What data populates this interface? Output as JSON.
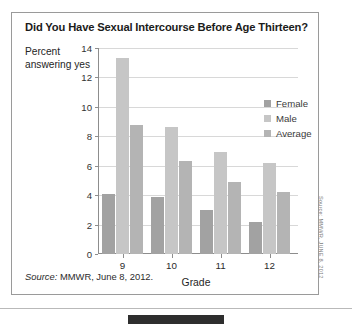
{
  "card": {
    "title": "Did You Have Sexual Intercourse Before Age Thirteen?",
    "source_prefix": "Source:",
    "source_text": " MMWR, June 8, 2012.",
    "credit": "Source: MMWR, JUNE 8, 2012"
  },
  "colors": {
    "female": "#a2a2a2",
    "male": "#c6c6c6",
    "average": "#b4b4b4",
    "gridline": "#d8d8d8",
    "axis": "#8d8d8d",
    "title": "#1b1b1b"
  },
  "chart_data": {
    "type": "bar",
    "title": "Did You Have Sexual Intercourse Before Age Thirteen?",
    "xlabel": "Grade",
    "ylabel": "Percent answering yes",
    "categories": [
      "9",
      "10",
      "11",
      "12"
    ],
    "series": [
      {
        "name": "Female",
        "values": [
          4.1,
          3.9,
          3.0,
          2.2
        ]
      },
      {
        "name": "Male",
        "values": [
          13.3,
          8.6,
          6.9,
          6.2
        ]
      },
      {
        "name": "Average",
        "values": [
          8.8,
          6.3,
          4.9,
          4.2
        ]
      }
    ],
    "ylim": [
      0,
      14
    ],
    "yticks": [
      "0",
      "2",
      "4",
      "6",
      "8",
      "10",
      "12",
      "14"
    ],
    "ytick_values": [
      0,
      2,
      4,
      6,
      8,
      10,
      12,
      14
    ],
    "grid": true,
    "legend_position": "inside-top-right",
    "legend": [
      "Female",
      "Male",
      "Average"
    ]
  }
}
